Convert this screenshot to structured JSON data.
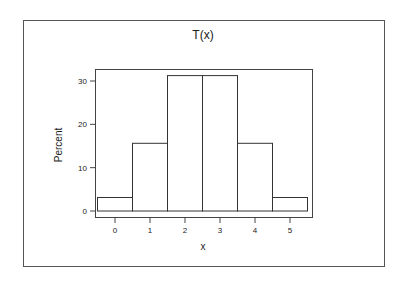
{
  "chart_data": {
    "type": "bar",
    "subtype": "histogram",
    "title": "T(x)",
    "xlabel": "x",
    "ylabel": "Percent",
    "categories": [
      "0",
      "1",
      "2",
      "3",
      "4",
      "5"
    ],
    "x": [
      0,
      1,
      2,
      3,
      4,
      5
    ],
    "values": [
      3.125,
      15.625,
      31.25,
      31.25,
      15.625,
      3.125
    ],
    "xticks": [
      "0",
      "1",
      "2",
      "3",
      "4",
      "5"
    ],
    "yticks": [
      "0",
      "10",
      "20",
      "30"
    ],
    "ytick_values": [
      0,
      10,
      20,
      30
    ],
    "xlim": [
      -0.6,
      5.6
    ],
    "ylim": [
      -1.4,
      32.5
    ],
    "grid": false,
    "legend": null,
    "bar_fill": "#ffffff",
    "bar_stroke": "#333333"
  }
}
